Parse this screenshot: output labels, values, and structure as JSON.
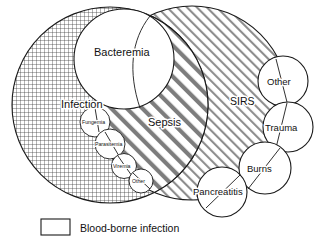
{
  "figure": {
    "type": "venn-diagram"
  },
  "regions": {
    "infection": {
      "label": "Infection",
      "fill_pattern": "crosshatch-grid",
      "fill_color": "#ffffff",
      "stroke_color": "#1a1a1a"
    },
    "sirs": {
      "label": "SIRS",
      "fill_pattern": "diagonal-thin-stripes",
      "fill_color": "#ffffff",
      "stroke_color": "#1a1a1a"
    },
    "sepsis": {
      "label": "Sepsis",
      "fill_pattern": "diagonal-thick-stripes",
      "fill_color": "#ffffff",
      "stroke_color": "#1a1a1a"
    },
    "bacteremia": {
      "label": "Bacteremia",
      "fill_pattern": "none",
      "fill_color": "#ffffff",
      "stroke_color": "#1a1a1a"
    }
  },
  "blood_borne_circles": [
    {
      "label": "Fungemia"
    },
    {
      "label": "Parasitemia"
    },
    {
      "label": "Viremia"
    },
    {
      "label": "Other"
    }
  ],
  "sirs_satellites": [
    {
      "label": "Other"
    },
    {
      "label": "Trauma"
    },
    {
      "label": "Burns"
    },
    {
      "label": "Pancreatitis"
    }
  ],
  "legend": {
    "swatch_fill": "#ffffff",
    "swatch_stroke": "#1a1a1a",
    "label": "Blood-borne infection"
  }
}
